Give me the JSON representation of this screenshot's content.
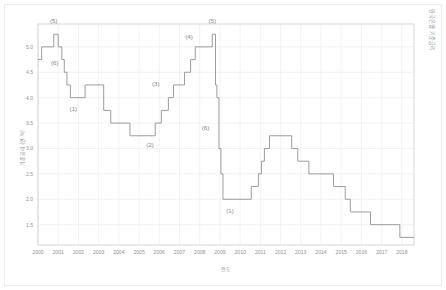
{
  "figure": {
    "corner_title": "한국은행 기준금리",
    "background_color": "#ffffff",
    "line_color": "#9a9ca0",
    "grid_color": "#ededee",
    "axis_color": "#c9cacc",
    "text_color": "#8f9195"
  },
  "chart_data": {
    "type": "line",
    "title": "한국은행 기준금리",
    "subtitle": "",
    "xlabel": "연도",
    "ylabel": "기준금리 (연 %)",
    "xlim": [
      2000,
      2018.6
    ],
    "ylim": [
      1.1,
      5.45
    ],
    "grid": true,
    "legend_position": "none",
    "step_style": "post",
    "xticks": [
      2000,
      2001,
      2002,
      2003,
      2004,
      2005,
      2006,
      2007,
      2008,
      2009,
      2010,
      2011,
      2012,
      2013,
      2014,
      2015,
      2016,
      2017,
      2018
    ],
    "xtick_labels": [
      "2000",
      "2001",
      "2002",
      "2003",
      "2004",
      "2005",
      "2006",
      "2007",
      "2008",
      "2009",
      "2010",
      "2011",
      "2012",
      "2013",
      "2014",
      "2015",
      "2016",
      "2017",
      "2018"
    ],
    "yticks": [
      1.5,
      2.0,
      2.5,
      3.0,
      3.5,
      4.0,
      4.5,
      5.0
    ],
    "ytick_labels": [
      "1.5",
      "2.0",
      "2.5",
      "3.0",
      "3.5",
      "4.0",
      "4.5",
      "5.0"
    ],
    "series": [
      {
        "name": "기준금리",
        "x": [
          2000.0,
          2000.18,
          2000.78,
          2001.0,
          2001.18,
          2001.3,
          2001.43,
          2001.6,
          2001.78,
          2002.33,
          2003.25,
          2003.6,
          2004.55,
          2004.88,
          2005.8,
          2006.1,
          2006.45,
          2006.7,
          2007.25,
          2007.55,
          2007.78,
          2008.25,
          2008.62,
          2008.78,
          2008.85,
          2008.95,
          2009.05,
          2009.15,
          2010.55,
          2010.9,
          2011.05,
          2011.2,
          2011.45,
          2012.55,
          2012.85,
          2013.4,
          2014.62,
          2015.2,
          2015.45,
          2016.45,
          2017.9,
          2018.6
        ],
        "y": [
          4.75,
          5.0,
          5.25,
          5.0,
          4.75,
          4.5,
          4.25,
          4.0,
          4.0,
          4.25,
          3.75,
          3.5,
          3.25,
          3.25,
          3.5,
          3.75,
          4.0,
          4.25,
          4.5,
          4.75,
          5.0,
          5.0,
          5.25,
          4.25,
          4.0,
          3.0,
          2.5,
          2.0,
          2.25,
          2.5,
          2.75,
          3.0,
          3.25,
          3.0,
          2.75,
          2.5,
          2.25,
          2.0,
          1.75,
          1.5,
          1.25,
          1.25
        ]
      }
    ],
    "annotations": [
      {
        "label": "(5)",
        "x": 2000.78,
        "y": 5.25,
        "dx": 0,
        "dy": -11,
        "meaning": "고점"
      },
      {
        "label": "(6)",
        "x": 2001.22,
        "y": 4.72,
        "dx": -8,
        "dy": 4,
        "meaning": "하락 전환"
      },
      {
        "label": "(1)",
        "x": 2001.85,
        "y": 4.0,
        "dx": -2,
        "dy": 13,
        "meaning": "저점"
      },
      {
        "label": "(2)",
        "x": 2005.05,
        "y": 3.25,
        "dx": 10,
        "dy": 11,
        "meaning": "저점"
      },
      {
        "label": "(3)",
        "x": 2006.32,
        "y": 4.22,
        "dx": -10,
        "dy": 0,
        "meaning": "상승 구간"
      },
      {
        "label": "(4)",
        "x": 2007.62,
        "y": 5.0,
        "dx": -3,
        "dy": -8,
        "meaning": "상승 구간"
      },
      {
        "label": "(5)",
        "x": 2008.62,
        "y": 5.25,
        "dx": 0,
        "dy": -11,
        "meaning": "고점"
      },
      {
        "label": "(6)",
        "x": 2008.78,
        "y": 3.4,
        "dx": -10,
        "dy": 2,
        "meaning": "급락"
      },
      {
        "label": "(1)",
        "x": 2009.5,
        "y": 2.0,
        "dx": 0,
        "dy": 14,
        "meaning": "저점"
      }
    ]
  }
}
